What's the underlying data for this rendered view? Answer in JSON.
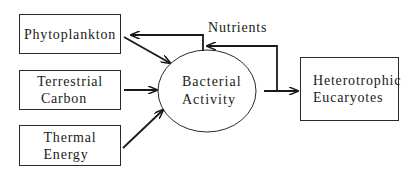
{
  "diagram": {
    "nodes": {
      "phytoplankton": {
        "label": "Phytoplankton"
      },
      "terrestrial_carbon": {
        "label_line1": "Terrestrial",
        "label_line2": "Carbon"
      },
      "thermal_energy": {
        "label_line1": "Thermal",
        "label_line2": "Energy"
      },
      "bacterial_activity": {
        "label_line1": "Bacterial",
        "label_line2": "Activity",
        "shape": "ellipse"
      },
      "heterotrophic_eucaryotes": {
        "label_line1": "Heterotrophic",
        "label_line2": "Eucaryotes"
      }
    },
    "edge_labels": {
      "nutrients": "Nutrients"
    },
    "edges": [
      {
        "from": "Phytoplankton",
        "to": "Bacterial Activity"
      },
      {
        "from": "Terrestrial Carbon",
        "to": "Bacterial Activity"
      },
      {
        "from": "Thermal Energy",
        "to": "Bacterial Activity"
      },
      {
        "from": "Bacterial Activity",
        "to": "Heterotrophic Eucaryotes"
      },
      {
        "from": "Bacterial Activity",
        "to": "Phytoplankton",
        "label": "Nutrients"
      },
      {
        "from": "Heterotrophic Eucaryotes",
        "to": "Bacterial Activity",
        "label": "Nutrients"
      }
    ],
    "colors": {
      "stroke": "#1a1a1a",
      "background": "#ffffff"
    }
  }
}
